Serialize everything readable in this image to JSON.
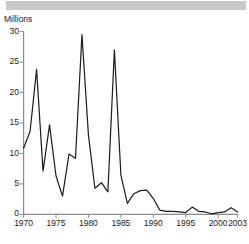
{
  "figure": {
    "unit_label": "Millions",
    "title_band_text": "",
    "footer_ghost_text": ""
  },
  "chart_data": {
    "type": "line",
    "title": "",
    "subtitle": "",
    "xlabel": "",
    "ylabel": "Millions",
    "xlim": [
      1970,
      2003
    ],
    "ylim": [
      0,
      30
    ],
    "yticks": [
      0,
      5,
      10,
      15,
      20,
      25,
      30
    ],
    "ytick_labels": [
      "0",
      "5",
      "10",
      "15",
      "20",
      "25",
      "30"
    ],
    "xticks": [
      1970,
      1975,
      1980,
      1985,
      1990,
      1995,
      2000,
      2003
    ],
    "xtick_labels": [
      "1970",
      "1975",
      "1980",
      "1985",
      "1990",
      "1995",
      "2000",
      "2003"
    ],
    "grid": false,
    "legend": false,
    "legend_position": "none",
    "line_color": "#1b1b1b",
    "line_width": 1.2,
    "markers": false,
    "x": [
      1970,
      1971,
      1972,
      1973,
      1974,
      1975,
      1976,
      1977,
      1978,
      1979,
      1980,
      1981,
      1982,
      1983,
      1984,
      1985,
      1986,
      1987,
      1988,
      1989,
      1990,
      1991,
      1992,
      1993,
      1994,
      1995,
      1996,
      1997,
      1998,
      1999,
      2000,
      2001,
      2002,
      2003
    ],
    "values": [
      10.9,
      13.6,
      23.8,
      7.1,
      14.7,
      6.3,
      3.0,
      9.9,
      9.2,
      29.5,
      13.0,
      4.3,
      5.2,
      3.7,
      27.0,
      6.5,
      1.8,
      3.4,
      3.9,
      4.0,
      2.6,
      0.7,
      0.5,
      0.5,
      0.4,
      0.3,
      1.2,
      0.5,
      0.4,
      0.1,
      0.3,
      0.4,
      1.1,
      0.4
    ],
    "series": [
      {
        "name": "Millions",
        "values": [
          10.9,
          13.6,
          23.8,
          7.1,
          14.7,
          6.3,
          3.0,
          9.9,
          9.2,
          29.5,
          13.0,
          4.3,
          5.2,
          3.7,
          27.0,
          6.5,
          1.8,
          3.4,
          3.9,
          4.0,
          2.6,
          0.7,
          0.5,
          0.5,
          0.4,
          0.3,
          1.2,
          0.5,
          0.4,
          0.1,
          0.3,
          0.4,
          1.1,
          0.4
        ]
      }
    ],
    "annotations": []
  }
}
